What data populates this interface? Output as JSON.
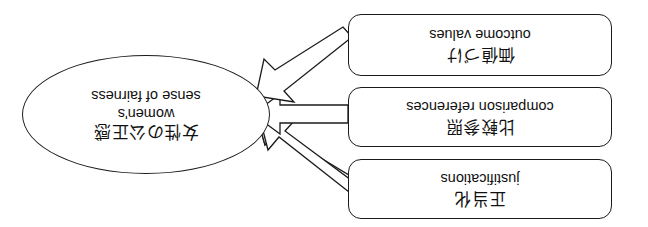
{
  "figure": {
    "type": "concept-diagram",
    "orientation": "rotated-180",
    "background_color": "#ffffff",
    "stroke_color": "#1b1b1b"
  },
  "target": {
    "shape": "ellipse",
    "label_en_line1": "women's",
    "label_en_line2": "sense of fairness",
    "label_jp": "女性の公正感"
  },
  "sources": [
    {
      "id": "justifications",
      "shape": "rounded-rectangle",
      "label_en": "justifications",
      "label_jp": "正当化",
      "arrow_direction": "down-right"
    },
    {
      "id": "comparison-references",
      "shape": "rounded-rectangle",
      "label_en": "comparison references",
      "label_jp": "比較参照",
      "arrow_direction": "right"
    },
    {
      "id": "outcome-values",
      "shape": "rounded-rectangle",
      "label_en": "outcome values",
      "label_jp": "価値づけ",
      "arrow_direction": "up-right"
    }
  ],
  "arrows": [
    {
      "id": "arrow-justifications",
      "from": "justifications",
      "to": "women's sense of fairness",
      "style": "block-arrow"
    },
    {
      "id": "arrow-comparison",
      "from": "comparison-references",
      "to": "women's sense of fairness",
      "style": "block-arrow"
    },
    {
      "id": "arrow-outcome",
      "from": "outcome-values",
      "to": "women's sense of fairness",
      "style": "block-arrow"
    }
  ]
}
